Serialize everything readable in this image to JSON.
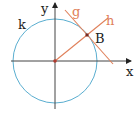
{
  "diagram": {
    "labels": {
      "y_axis": "y",
      "x_axis": "x",
      "circle": "k",
      "tangent": "g",
      "ray": "h",
      "point": "B"
    },
    "colors": {
      "axis": "#333333",
      "circle": "#4a9fc4",
      "lines": "#e0805a",
      "point": "#a0302a",
      "text": "#222222"
    }
  }
}
